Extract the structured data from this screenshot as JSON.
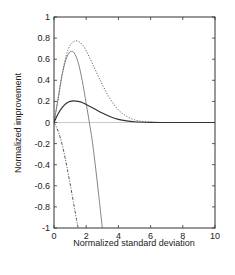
{
  "chart_data": {
    "type": "line",
    "title": "",
    "xlabel": "Normalized standard deviation",
    "ylabel": "Normalized improvement",
    "xlim": [
      0,
      10
    ],
    "ylim": [
      -1,
      1
    ],
    "xticks": [
      0,
      2,
      4,
      6,
      8,
      10
    ],
    "xtick_labels": [
      "0",
      "2",
      "4",
      "6",
      "8",
      "10"
    ],
    "yticks": [
      1,
      0.8,
      0.6,
      0.4,
      0.2,
      0,
      -0.2,
      -0.4,
      -0.6,
      -0.8,
      -1
    ],
    "ytick_labels": [
      "1",
      "0.8",
      "0.6",
      "0.4",
      "0.2",
      "0",
      "-0.2",
      "-0.4",
      "-0.6",
      "-0.8",
      "-1"
    ],
    "grid": false,
    "legend": null,
    "zero_line": true,
    "series": [
      {
        "name": "dotted-curve",
        "style": "dotted",
        "x": [
          0,
          0.25,
          0.5,
          0.75,
          1.0,
          1.25,
          1.5,
          1.75,
          2.0,
          2.5,
          3.0,
          3.5,
          4.0,
          4.5,
          5.0,
          5.5,
          6.0,
          7.0,
          8.0,
          10.0
        ],
        "values": [
          0,
          0.22,
          0.45,
          0.63,
          0.73,
          0.77,
          0.77,
          0.74,
          0.68,
          0.52,
          0.36,
          0.22,
          0.12,
          0.06,
          0.025,
          0.01,
          0.004,
          0.0,
          0.0,
          0.0
        ]
      },
      {
        "name": "solid-thin-curve",
        "style": "solid-thin",
        "x": [
          0,
          0.25,
          0.5,
          0.75,
          1.0,
          1.25,
          1.5,
          1.75,
          2.0,
          2.25,
          2.4,
          2.6,
          2.8,
          3.0
        ],
        "values": [
          0,
          0.22,
          0.45,
          0.6,
          0.67,
          0.66,
          0.57,
          0.4,
          0.18,
          -0.05,
          -0.2,
          -0.45,
          -0.72,
          -1.0
        ]
      },
      {
        "name": "solid-thick-curve",
        "style": "solid",
        "x": [
          0,
          0.25,
          0.5,
          0.75,
          1.0,
          1.25,
          1.5,
          1.75,
          2.0,
          2.5,
          3.0,
          3.5,
          4.0,
          4.5,
          5.0,
          6.0,
          7.0,
          8.0,
          10.0
        ],
        "values": [
          0,
          0.08,
          0.14,
          0.18,
          0.2,
          0.205,
          0.2,
          0.19,
          0.17,
          0.13,
          0.09,
          0.055,
          0.03,
          0.015,
          0.007,
          0.002,
          0.0,
          0.0,
          0.0
        ]
      },
      {
        "name": "dash-dot-curve",
        "style": "dash-dot",
        "x": [
          0,
          0.2,
          0.4,
          0.6,
          0.8,
          1.0,
          1.2,
          1.4,
          1.5
        ],
        "values": [
          0,
          -0.06,
          -0.15,
          -0.27,
          -0.42,
          -0.58,
          -0.75,
          -0.92,
          -1.0
        ]
      }
    ]
  }
}
